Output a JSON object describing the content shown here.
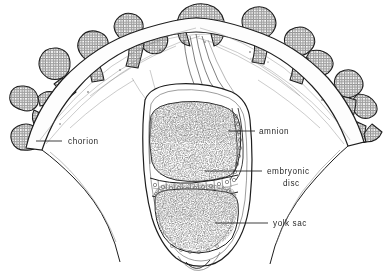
{
  "figure": {
    "style": "black and white pen-and-ink stipple line drawing",
    "ink_color": "#1a1a1a",
    "background_color": "#ffffff"
  },
  "labels": [
    {
      "id": "chorion",
      "text": "chorion",
      "text_x": 68,
      "text_y": 144,
      "anchor": "start",
      "leader": {
        "x1": 62,
        "y1": 141,
        "x2": 36,
        "y2": 141
      },
      "describes": "outer villous membrane surrounding the chorionic cavity"
    },
    {
      "id": "amnion",
      "text": "amnion",
      "text_x": 259,
      "text_y": 134,
      "anchor": "start",
      "leader": {
        "x1": 255,
        "y1": 131,
        "x2": 228,
        "y2": 131
      },
      "describes": "membrane enclosing the amniotic cavity above the embryonic disc"
    },
    {
      "id": "embryonic-disc",
      "text": "embryonic",
      "text2": "disc",
      "text_x": 267,
      "text_y": 174,
      "text2_x": 283,
      "text2_y": 186,
      "anchor": "start",
      "leader": {
        "x1": 262,
        "y1": 171,
        "x2": 205,
        "y2": 171
      },
      "describes": "bilaminar plate of columnar cells between amniotic cavity and yolk sac"
    },
    {
      "id": "yolk-sac",
      "text": "yolk sac",
      "text_x": 273,
      "text_y": 226,
      "anchor": "start",
      "leader": {
        "x1": 268,
        "y1": 223,
        "x2": 215,
        "y2": 223
      },
      "describes": "lower stippled cavity beneath the embryonic disc"
    }
  ],
  "structures": [
    {
      "name": "chorionic-villi",
      "count": 11,
      "description": "finger-like branching projections with cellular trophoblast border"
    },
    {
      "name": "chorionic-membrane",
      "description": "fibrous mesenchymal band forming the vesicle wall"
    },
    {
      "name": "chorionic-cavity",
      "description": "clear space between chorion and amnion"
    },
    {
      "name": "connecting-stalk",
      "description": "fibrous strands suspending the embryo from the chorion roof"
    },
    {
      "name": "amniotic-cavity",
      "description": "upper dark stippled chamber"
    },
    {
      "name": "yolk-sac-cavity",
      "description": "lower dark stippled chamber"
    },
    {
      "name": "embryonic-disc-cells",
      "count": 22,
      "description": "row of rectangular cells each with a round nucleus"
    }
  ]
}
